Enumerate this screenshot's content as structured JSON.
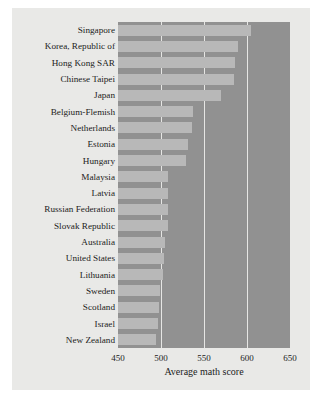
{
  "chart_data": {
    "type": "bar",
    "orientation": "horizontal",
    "title": "",
    "xlabel": "Average math score",
    "ylabel": "",
    "xlim": [
      450,
      650
    ],
    "xticks": [
      450,
      500,
      550,
      600,
      650
    ],
    "grid": true,
    "legend": null,
    "categories": [
      "Singapore",
      "Korea, Republic of",
      "Hong Kong SAR",
      "Chinese Taipei",
      "Japan",
      "Belgium-Flemish",
      "Netherlands",
      "Estonia",
      "Hungary",
      "Malaysia",
      "Latvia",
      "Russian Federation",
      "Slovak Republic",
      "Australia",
      "United States",
      "Lithuania",
      "Sweden",
      "Scotland",
      "Israel",
      "New Zealand"
    ],
    "values": [
      605,
      589,
      586,
      585,
      570,
      537,
      536,
      531,
      529,
      508,
      508,
      508,
      508,
      505,
      504,
      502,
      499,
      498,
      496,
      494
    ],
    "colors": {
      "bar": "#b8b8b8",
      "plot_background": "#919191",
      "gridline": "#e6e6e4",
      "panel_background": "#e9e9e7",
      "page_background": "#ffffff",
      "text": "#1c1c1c"
    }
  }
}
